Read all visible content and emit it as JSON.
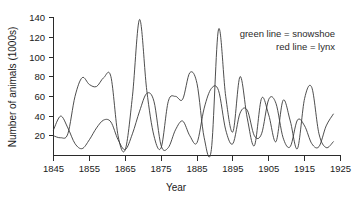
{
  "chart_data": {
    "type": "line",
    "title": "",
    "subtitle": "",
    "xlabel": "Year",
    "ylabel": "Number of animals (1000s)",
    "xlim": [
      1845,
      1925
    ],
    "ylim": [
      0,
      140
    ],
    "xticks": [
      1845,
      1855,
      1865,
      1875,
      1885,
      1895,
      1905,
      1915,
      1925
    ],
    "yticks": [
      20,
      40,
      60,
      80,
      100,
      120,
      140
    ],
    "grid": false,
    "legend_position": "top-right",
    "annotations": [
      "green line = snowshoe",
      "red line = lynx"
    ],
    "series": [
      {
        "name": "snowshoe",
        "legend_label": "green line = snowshoe",
        "color": "#3a3a3a",
        "x": [
          1845,
          1847,
          1849,
          1851,
          1853,
          1855,
          1857,
          1859,
          1861,
          1863,
          1865,
          1867,
          1869,
          1871,
          1873,
          1875,
          1877,
          1879,
          1881,
          1883,
          1885,
          1887,
          1889,
          1891,
          1893,
          1895,
          1897,
          1899,
          1901,
          1903,
          1905,
          1907,
          1909,
          1911,
          1913,
          1915,
          1917,
          1919,
          1921,
          1923
        ],
        "y": [
          20,
          18,
          22,
          60,
          79,
          72,
          70,
          79,
          80,
          20,
          6,
          60,
          138,
          66,
          20,
          8,
          55,
          60,
          57,
          84,
          73,
          18,
          6,
          128,
          60,
          24,
          80,
          38,
          10,
          58,
          41,
          14,
          56,
          35,
          7,
          58,
          69,
          22,
          8,
          14
        ],
        "peaks": [
          {
            "year": 1865,
            "value": 138
          },
          {
            "year": 1885,
            "value": 128
          },
          {
            "year": 1852,
            "value": 79
          },
          {
            "year": 1858,
            "value": 80
          },
          {
            "year": 1877,
            "value": 84
          },
          {
            "year": 1894,
            "value": 80
          },
          {
            "year": 1903,
            "value": 59
          },
          {
            "year": 1914,
            "value": 69
          }
        ]
      },
      {
        "name": "lynx",
        "legend_label": "red line = lynx",
        "color": "#3a3a3a",
        "x": [
          1845,
          1847,
          1849,
          1851,
          1853,
          1855,
          1857,
          1859,
          1861,
          1863,
          1865,
          1867,
          1869,
          1871,
          1873,
          1875,
          1877,
          1879,
          1881,
          1883,
          1885,
          1887,
          1889,
          1891,
          1893,
          1895,
          1897,
          1899,
          1901,
          1903,
          1905,
          1907,
          1909,
          1911,
          1913,
          1915,
          1917,
          1919,
          1921,
          1923
        ],
        "y": [
          26,
          40,
          28,
          12,
          7,
          16,
          28,
          36,
          34,
          16,
          6,
          22,
          45,
          63,
          55,
          10,
          8,
          26,
          35,
          20,
          13,
          48,
          68,
          66,
          26,
          12,
          43,
          46,
          20,
          22,
          57,
          53,
          18,
          9,
          36,
          30,
          12,
          9,
          30,
          42
        ],
        "peaks": [
          {
            "year": 1847,
            "value": 41
          },
          {
            "year": 1858,
            "value": 37
          },
          {
            "year": 1867,
            "value": 63
          },
          {
            "year": 1876,
            "value": 35
          },
          {
            "year": 1886,
            "value": 68
          },
          {
            "year": 1894,
            "value": 44
          },
          {
            "year": 1900,
            "value": 58
          },
          {
            "year": 1906,
            "value": 36
          },
          {
            "year": 1916,
            "value": 43
          }
        ]
      }
    ]
  },
  "axes": {
    "y_axis_title": "Number of animals (1000s)",
    "x_axis_title": "Year",
    "y_tick_labels": [
      "140",
      "120",
      "100",
      "80",
      "60",
      "40",
      "20"
    ],
    "x_tick_labels": [
      "1845",
      "1855",
      "1865",
      "1875",
      "1885",
      "1895",
      "1905",
      "1915",
      "1925"
    ]
  },
  "legend": {
    "line1": "green line = snowshoe",
    "line2": "red line = lynx"
  },
  "colors": {
    "axis": "#2b2b2b",
    "snowshoe_line": "#3a3a3a",
    "lynx_line": "#3a3a3a",
    "background": "#ffffff",
    "text": "#1a1a1a"
  }
}
